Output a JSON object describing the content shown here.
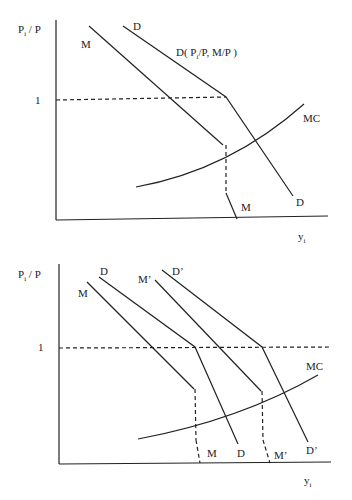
{
  "diagrams": [
    {
      "id": "top",
      "y_axis_label": "P",
      "y_axis_label_sub": "i",
      "y_axis_label_rest": " / P",
      "x_axis_label": "y",
      "x_axis_label_sub": "i",
      "price_level_tick": "1",
      "demand_label_top": "D",
      "demand_label_bottom": "D",
      "demand_function_label_pre": "D( P",
      "demand_function_label_sub": "i",
      "demand_function_label_post": "/P, M/P )",
      "money_label_top": "M",
      "money_label_bottom": "M",
      "mc_label": "MC"
    },
    {
      "id": "bottom",
      "y_axis_label": "P",
      "y_axis_label_sub": "i",
      "y_axis_label_rest": " / P",
      "x_axis_label": "y",
      "x_axis_label_sub": "i",
      "price_level_tick": "1",
      "demand_label_top": "D",
      "demand_label_bottom": "D",
      "demand_shifted_label_top": "D’",
      "demand_shifted_label_bottom": "D’",
      "money_label_top": "M",
      "money_label_bottom": "M",
      "money_shifted_label_top": "M’",
      "money_shifted_label_bottom": "M’",
      "mc_label": "MC"
    }
  ],
  "colors": {
    "ink": "#222222",
    "background": "#ffffff"
  }
}
